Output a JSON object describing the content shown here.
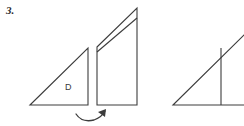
{
  "page": {
    "width": 244,
    "height": 126,
    "background_color": "#ffffff",
    "stroke_color": "#3c3c3c",
    "text_color": "#2b2b2b"
  },
  "problem": {
    "number_label": "3.",
    "kind": "geometry-transformation-figure"
  },
  "figures": {
    "original_triangle": {
      "name": "triangle-D",
      "label": "D",
      "label_position": {
        "x": 65,
        "y": 83
      },
      "points": [
        {
          "x": 30,
          "y": 105
        },
        {
          "x": 88,
          "y": 48
        },
        {
          "x": 88,
          "y": 105
        }
      ],
      "description": "right triangle with right angle at lower right"
    },
    "sheared_figure": {
      "name": "sheared-quadrilateral",
      "outline_points": [
        {
          "x": 97,
          "y": 47
        },
        {
          "x": 137,
          "y": 8
        },
        {
          "x": 137,
          "y": 105
        },
        {
          "x": 97,
          "y": 105
        }
      ],
      "interior_line": {
        "from": {
          "x": 97,
          "y": 52
        },
        "to": {
          "x": 137,
          "y": 18
        }
      },
      "description": "tall quadrilateral with slanted top and a parallel interior diagonal"
    },
    "result_triangle": {
      "name": "triangle-result",
      "points": [
        {
          "x": 173,
          "y": 105
        },
        {
          "x": 244,
          "y": 34
        },
        {
          "x": 244,
          "y": 105
        }
      ],
      "interior_line": {
        "from": {
          "x": 221,
          "y": 48
        },
        "to": {
          "x": 221,
          "y": 105
        }
      },
      "description": "right triangle clipped by the right edge of the image, with a vertical interior segment"
    }
  },
  "annotations": {
    "rotation_arrow": {
      "name": "curved-rotation-arrow",
      "path": "M 76 115 Q 84 124 96 119 Q 103 116 105 111",
      "arrowhead_points": "105,110 99,113 105,117",
      "direction": "clockwise-right",
      "description": "curved arrow beneath the first two figures indicating the transformation"
    }
  },
  "colors": {
    "ink": "#3c3c3c",
    "ink_dark": "#2b2b2b",
    "paper": "#ffffff"
  }
}
